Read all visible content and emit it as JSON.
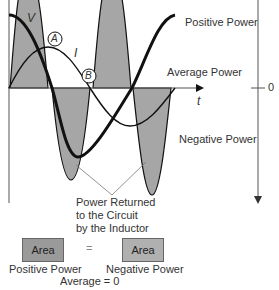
{
  "diagram": {
    "curves": {
      "voltage_label": "V",
      "current_label": "I",
      "point_a": "A",
      "point_b": "B"
    },
    "axis": {
      "time_label": "t",
      "zero_label": "0"
    },
    "labels": {
      "positive_power": "Positive Power",
      "average_power": "Average Power",
      "negative_power": "Negative Power",
      "returned_line1": "Power Returned",
      "returned_line2": "to the Circuit",
      "returned_line3": "by the Inductor"
    },
    "equation": {
      "left_box": "Area",
      "equals": "=",
      "right_box": "Area",
      "left_caption": "Positive Power",
      "right_caption": "Negative Power",
      "result": "Average = 0"
    },
    "colors": {
      "shade": "#a6a6a6",
      "curve": "#111111",
      "axis": "#555555"
    }
  }
}
